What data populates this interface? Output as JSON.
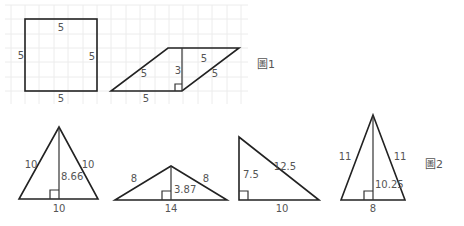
{
  "figure1": {
    "caption": "圖1",
    "square": {
      "top": "5",
      "bottom": "5",
      "left": "5",
      "right": "5"
    },
    "parallelogram": {
      "base": "5",
      "top": "5",
      "left_side": "5",
      "right_side": "5",
      "height": "3"
    }
  },
  "figure2": {
    "caption": "圖2",
    "triangles": [
      {
        "left": "10",
        "right": "10",
        "height": "8.66",
        "base": "10"
      },
      {
        "left": "8",
        "right": "8",
        "height": "3.87",
        "base": "14"
      },
      {
        "vertical": "7.5",
        "hypotenuse": "12.5",
        "base": "10"
      },
      {
        "left": "11",
        "right": "11",
        "height": "10.25",
        "base": "8"
      }
    ]
  },
  "colors": {
    "stroke": "#222222",
    "label": "#555555",
    "grid": "#ececec"
  }
}
